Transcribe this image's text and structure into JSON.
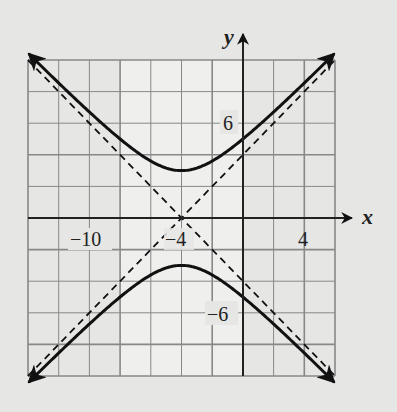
{
  "chart_data": {
    "type": "line",
    "title": "",
    "xlabel": "x",
    "ylabel": "y",
    "xlim": [
      -14,
      6
    ],
    "ylim": [
      -10,
      10
    ],
    "grid": true,
    "grid_step": 2,
    "x_tick_labels": [
      "-10",
      "-4",
      "4"
    ],
    "y_tick_labels": [
      "6",
      "-6"
    ],
    "equation": "y^2/9 - (x+4)^2/9 = 1",
    "center": [
      -4,
      0
    ],
    "vertices": [
      [
        -4,
        3
      ],
      [
        -4,
        -3
      ]
    ],
    "series": [
      {
        "name": "upper branch",
        "style": "solid",
        "formula": "y = 3*sqrt(1 + (x+4)^2/9)"
      },
      {
        "name": "lower branch",
        "style": "solid",
        "formula": "y = -3*sqrt(1 + (x+4)^2/9)"
      },
      {
        "name": "asymptote 1",
        "style": "dashed",
        "formula": "y = x + 4"
      },
      {
        "name": "asymptote 2",
        "style": "dashed",
        "formula": "y = -(x + 4)"
      }
    ]
  },
  "labels": {
    "x_axis": "x",
    "y_axis": "y",
    "xtick_m10": "−10",
    "xtick_m4": "−4",
    "xtick_4": "4",
    "ytick_6": "6",
    "ytick_m6": "−6"
  }
}
